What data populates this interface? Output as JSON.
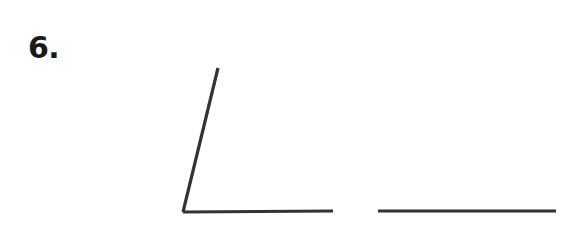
{
  "page": {
    "background_color": "#ffffff",
    "width": 571,
    "height": 241
  },
  "problem": {
    "number_label": "6.",
    "number_color": "#1a1a1a"
  },
  "figure": {
    "stroke_color": "#333333",
    "stroke_width": 3.2,
    "angle": {
      "name": "acute-angle-figure",
      "vertex": {
        "x": 183,
        "y": 212
      },
      "ray_slanted_end": {
        "x": 218,
        "y": 68
      },
      "ray_horizontal_end": {
        "x": 333,
        "y": 211
      },
      "approx_degrees": 76
    },
    "separate_segment": {
      "name": "reference-line-segment",
      "start": {
        "x": 378,
        "y": 211
      },
      "end": {
        "x": 556,
        "y": 211
      }
    }
  },
  "chart_data": {
    "type": "line",
    "title": "",
    "xlabel": "",
    "ylabel": "",
    "grid": false,
    "legend": "none",
    "series": [
      {
        "name": "angle-ray-slanted",
        "x": [
          183,
          218
        ],
        "y": [
          212,
          68
        ]
      },
      {
        "name": "angle-ray-horizontal",
        "x": [
          183,
          333
        ],
        "y": [
          212,
          211
        ]
      },
      {
        "name": "separate-segment",
        "x": [
          378,
          556
        ],
        "y": [
          211,
          211
        ]
      }
    ],
    "annotations": [
      "6."
    ],
    "xlim": [
      0,
      571
    ],
    "ylim": [
      241,
      0
    ]
  }
}
